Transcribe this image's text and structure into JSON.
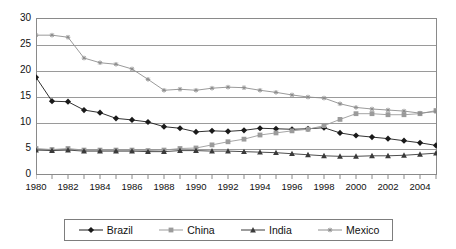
{
  "chart_data": {
    "type": "line",
    "title": "",
    "subtitle": "",
    "xlabel": "",
    "ylabel": "",
    "xlim": [
      1980,
      2005
    ],
    "ylim": [
      0,
      30
    ],
    "yticks": [
      0,
      5,
      10,
      15,
      20,
      25,
      30
    ],
    "xticks": [
      1980,
      1982,
      1984,
      1986,
      1988,
      1990,
      1992,
      1994,
      1996,
      1998,
      2000,
      2002,
      2004
    ],
    "xtick_minor_step": 1,
    "grid": "horizontal",
    "legend_position": "bottom",
    "x": [
      1980,
      1981,
      1982,
      1983,
      1984,
      1985,
      1986,
      1987,
      1988,
      1989,
      1990,
      1991,
      1992,
      1993,
      1994,
      1995,
      1996,
      1997,
      1998,
      1999,
      2000,
      2001,
      2002,
      2003,
      2004,
      2005
    ],
    "series": [
      {
        "name": "Brazil",
        "marker": "diamond",
        "color": "#1a1a1a",
        "values": [
          18.6,
          14.0,
          13.9,
          12.3,
          11.8,
          10.7,
          10.4,
          10.0,
          9.1,
          8.8,
          8.1,
          8.3,
          8.2,
          8.4,
          8.8,
          8.7,
          8.6,
          8.7,
          8.9,
          7.9,
          7.4,
          7.1,
          6.8,
          6.4,
          6.0,
          5.5
        ]
      },
      {
        "name": "China",
        "marker": "square",
        "color": "#9b9b9b",
        "values": [
          4.9,
          4.7,
          4.9,
          4.6,
          4.6,
          4.6,
          4.6,
          4.5,
          4.6,
          4.9,
          5.0,
          5.6,
          6.2,
          6.7,
          7.5,
          7.9,
          8.3,
          8.6,
          9.3,
          10.5,
          11.6,
          11.6,
          11.4,
          11.4,
          11.6,
          12.2
        ]
      },
      {
        "name": "India",
        "marker": "triangle",
        "color": "#3a3a3a",
        "values": [
          4.6,
          4.5,
          4.6,
          4.4,
          4.4,
          4.4,
          4.4,
          4.3,
          4.3,
          4.5,
          4.5,
          4.4,
          4.4,
          4.3,
          4.2,
          4.1,
          3.9,
          3.7,
          3.5,
          3.4,
          3.4,
          3.5,
          3.5,
          3.6,
          3.8,
          4.0
        ]
      },
      {
        "name": "Mexico",
        "marker": "asterisk",
        "color": "#8e8e8e",
        "values": [
          26.7,
          26.7,
          26.3,
          22.3,
          21.4,
          21.1,
          20.2,
          18.2,
          16.1,
          16.3,
          16.1,
          16.5,
          16.7,
          16.6,
          16.1,
          15.7,
          15.2,
          14.8,
          14.6,
          13.5,
          12.8,
          12.5,
          12.3,
          12.1,
          11.7,
          12.0
        ]
      }
    ]
  },
  "legend": {
    "items": [
      {
        "label": "Brazil"
      },
      {
        "label": "China"
      },
      {
        "label": "India"
      },
      {
        "label": "Mexico"
      }
    ]
  }
}
